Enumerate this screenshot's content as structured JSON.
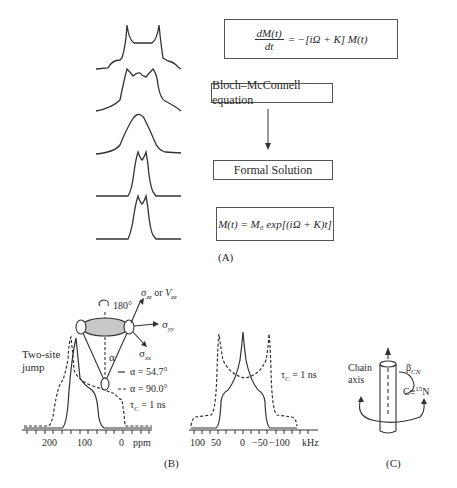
{
  "panel_a": {
    "label": "(A)",
    "boxes": {
      "equation": "dM(t)/dt = −[iΩ + K] M(t)",
      "equation_num": "dM(t)",
      "equation_den": "dt",
      "equation_rhs": "= −[iΩ + K] M(t)",
      "bloch": "Bloch–McConnell equation",
      "formal": "Formal Solution",
      "solution": "M(t) = M₀ exp[(iΩ + K)t]"
    },
    "spectra_count": 5
  },
  "panel_b": {
    "label": "(B)",
    "rotation_label": "180°",
    "sigma_zz_label": "σzz or Vzz",
    "sigma_yy_label": "σyy",
    "sigma_xx_label": "σxx",
    "alpha_label": "α",
    "two_site_jump": [
      "Two-site",
      "jump"
    ],
    "legend": [
      {
        "style": "solid",
        "text": "α = 54.7°"
      },
      {
        "style": "dashed",
        "text": "α = 90.0°"
      }
    ],
    "tau_c_left": "τC = 1 ns",
    "tau_c_right": "τC = 1 ns",
    "ppm_axis": {
      "ticks": [
        "200",
        "100",
        "0"
      ],
      "unit": "ppm"
    },
    "khz_axis": {
      "ticks": [
        "100",
        "50",
        "0",
        "−50",
        "−100"
      ],
      "unit": "kHz"
    }
  },
  "panel_c": {
    "label": "(C)",
    "chain_axis": [
      "Chain",
      "axis"
    ],
    "beta_label": "βCN",
    "bond_label": "C≡15N"
  }
}
